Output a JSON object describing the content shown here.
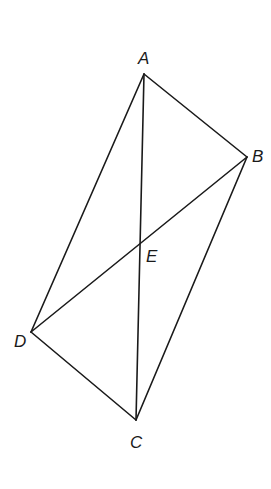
{
  "diagram": {
    "type": "quadrilateral-with-diagonals",
    "vertices": {
      "A": {
        "label": "A",
        "x": 144,
        "y": 74,
        "label_x": 138,
        "label_y": 64
      },
      "B": {
        "label": "B",
        "x": 247,
        "y": 157,
        "label_x": 252,
        "label_y": 162
      },
      "C": {
        "label": "C",
        "x": 136,
        "y": 420,
        "label_x": 130,
        "label_y": 448
      },
      "D": {
        "label": "D",
        "x": 31,
        "y": 332,
        "label_x": 14,
        "label_y": 347
      },
      "E": {
        "label": "E",
        "x": 141,
        "y": 241,
        "label_x": 146,
        "label_y": 262
      }
    },
    "edges": [
      {
        "from": "A",
        "to": "B"
      },
      {
        "from": "B",
        "to": "C"
      },
      {
        "from": "C",
        "to": "D"
      },
      {
        "from": "D",
        "to": "A"
      }
    ],
    "diagonals": [
      {
        "from": "A",
        "to": "C"
      },
      {
        "from": "B",
        "to": "D"
      }
    ],
    "intersection": "E",
    "colors": {
      "stroke": "#1a1a1a",
      "background": "#ffffff"
    }
  }
}
